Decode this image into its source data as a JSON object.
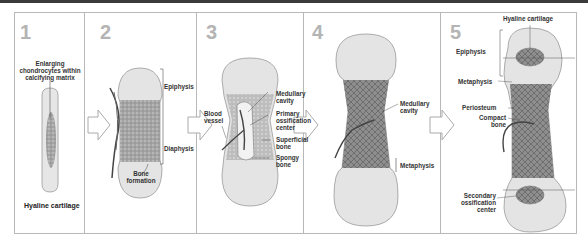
{
  "diagram": {
    "panels": [
      {
        "number": "1",
        "labels": {
          "top": "Enlarging chondrocytes within calcifying matrix",
          "top_lines": [
            "Enlarging",
            "chondrocytes within",
            "calcifying matrix"
          ],
          "bottom": "Hyaline cartilage"
        }
      },
      {
        "number": "2",
        "labels": {
          "epiphysis": "Epiphysis",
          "diaphysis": "Diaphysis",
          "bone_formation_lines": [
            "Bone",
            "formation"
          ]
        }
      },
      {
        "number": "3",
        "labels": {
          "blood_vessel_lines": [
            "Blood",
            "vessel"
          ],
          "medullary_cavity_lines": [
            "Medullary",
            "cavity"
          ],
          "primary_ossification_lines": [
            "Primary",
            "ossification",
            "center"
          ],
          "superficial_bone_lines": [
            "Superficial",
            "bone"
          ],
          "spongy_bone_lines": [
            "Spongy",
            "bone"
          ]
        }
      },
      {
        "number": "4",
        "labels": {
          "medullary_cavity_lines": [
            "Medullary",
            "cavity"
          ],
          "metaphysis": "Metaphysis"
        }
      },
      {
        "number": "5",
        "labels": {
          "hyaline_cartilage": "Hyaline cartilage",
          "epiphysis": "Epiphysis",
          "metaphysis": "Metaphysis",
          "periosteum": "Periosteum",
          "compact_bone_lines": [
            "Compact",
            "bone"
          ],
          "secondary_ossification_lines": [
            "Secondary",
            "ossification",
            "center"
          ]
        }
      }
    ],
    "colors": {
      "cartilage": "#e6e6e6",
      "bone": "#9a9a9a",
      "number": "#b4b4b4",
      "border": "#b8b8b8",
      "arrow": "#ffffff"
    }
  }
}
